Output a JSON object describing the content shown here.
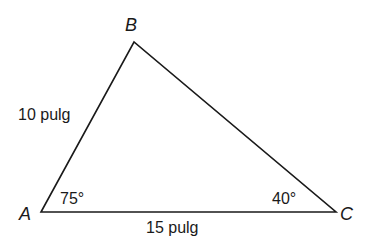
{
  "diagram": {
    "type": "triangle",
    "vertices": {
      "A": {
        "label": "A",
        "x": 41,
        "y": 212
      },
      "B": {
        "label": "B",
        "x": 134,
        "y": 42
      },
      "C": {
        "label": "C",
        "x": 336,
        "y": 212
      }
    },
    "sides": {
      "AB": {
        "label": "10 pulg"
      },
      "AC": {
        "label": "15 pulg"
      }
    },
    "angles": {
      "A": {
        "label": "75°"
      },
      "C": {
        "label": "40°"
      }
    },
    "stroke_color": "#1a1a1a"
  }
}
